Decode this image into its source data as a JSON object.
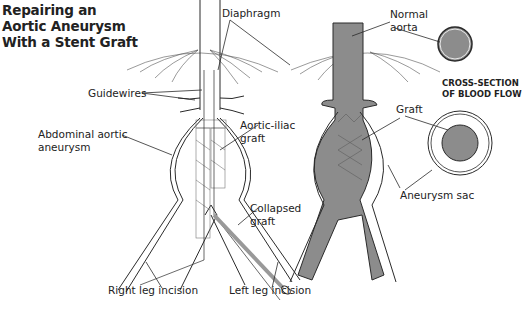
{
  "title": {
    "line1": "Repairing an",
    "line2": "Aortic Aneurysm",
    "line3": "With a Stent Graft"
  },
  "labels": {
    "diaphragm": "Diaphragm",
    "guidewires": "Guidewires",
    "abdominal_line1": "Abdominal aortic",
    "abdominal_line2": "aneurysm",
    "aortic_iliac_line1": "Aortic-iliac",
    "aortic_iliac_line2": "graft",
    "collapsed_line1": "Collapsed",
    "collapsed_line2": "graft",
    "right_leg": "Right leg incision",
    "left_leg": "Left leg incision",
    "normal_line1": "Normal",
    "normal_line2": "aorta",
    "graft": "Graft",
    "aneurysm_sac": "Aneurysm sac"
  },
  "cross_section": {
    "line1": "CROSS-SECTION",
    "line2": "OF BLOOD FLOW"
  },
  "colors": {
    "blood": "#8c8c8c",
    "line": "#2a2a2a",
    "text": "#222222"
  }
}
